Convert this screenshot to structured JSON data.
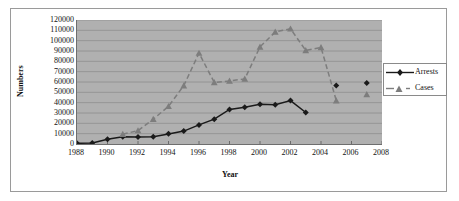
{
  "chart_data": {
    "type": "line",
    "title": "",
    "xlabel": "Year",
    "ylabel": "Numbers",
    "xlim": [
      1988,
      2008
    ],
    "ylim": [
      0,
      120000
    ],
    "xticks": [
      1988,
      1990,
      1992,
      1994,
      1996,
      1998,
      2000,
      2002,
      2004,
      2006,
      2008
    ],
    "yticks": [
      0,
      10000,
      20000,
      30000,
      40000,
      50000,
      60000,
      70000,
      80000,
      90000,
      100000,
      110000,
      120000
    ],
    "grid": "horizontal",
    "legend_position": "right",
    "plot_background": "#b0b0b0",
    "series": [
      {
        "name": "Arrests",
        "color": "#1a1a1a",
        "marker": "diamond",
        "line_style": "solid",
        "x": [
          1988,
          1989,
          1990,
          1991,
          1992,
          1993,
          1994,
          1995,
          1996,
          1997,
          1998,
          1999,
          2000,
          2001,
          2002,
          2003,
          2005,
          2007
        ],
        "values": [
          700,
          900,
          4500,
          7000,
          6700,
          7000,
          9800,
          12500,
          18500,
          24000,
          33500,
          35500,
          38500,
          38000,
          42000,
          30500,
          56500,
          59000
        ]
      },
      {
        "name": "Cases",
        "color": "#7d7d7d",
        "marker": "triangle",
        "line_style": "dashed",
        "x": [
          1991,
          1992,
          1993,
          1994,
          1995,
          1996,
          1997,
          1998,
          1999,
          2000,
          2001,
          2002,
          2003,
          2004,
          2005,
          2007
        ],
        "values": [
          9500,
          13000,
          24000,
          36500,
          56500,
          88000,
          59500,
          61000,
          63000,
          94000,
          108500,
          111500,
          90500,
          93500,
          42000,
          48000
        ]
      }
    ]
  },
  "legend": {
    "items": [
      {
        "label": "Arrests"
      },
      {
        "label": "Cases"
      }
    ]
  },
  "axis_titles": {
    "y": "Numbers",
    "x": "Year"
  }
}
